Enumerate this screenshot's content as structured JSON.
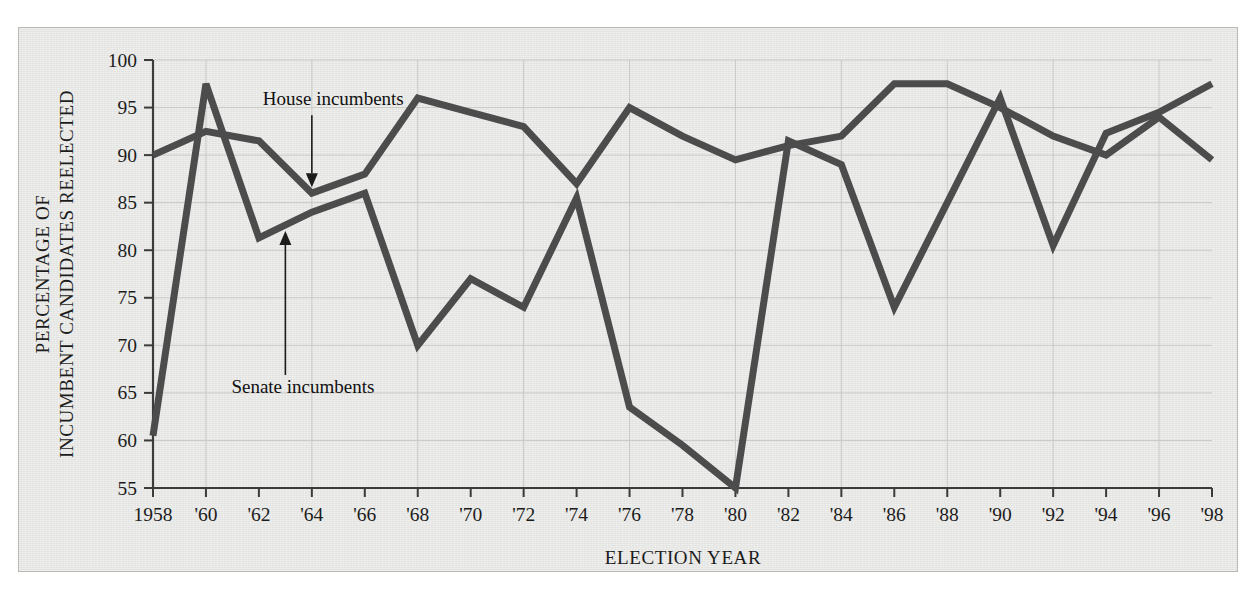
{
  "chart_data": {
    "type": "line",
    "title": "",
    "xlabel": "ELECTION YEAR",
    "ylabel": "PERCENTAGE OF INCUMBENT CANDIDATES REELECTED",
    "xlim": [
      1958,
      1998
    ],
    "ylim": [
      55,
      100
    ],
    "grid": true,
    "legend_position": "inline-annotations",
    "x": [
      1958,
      1960,
      1962,
      1964,
      1966,
      1968,
      1970,
      1972,
      1974,
      1976,
      1978,
      1980,
      1982,
      1984,
      1986,
      1988,
      1990,
      1992,
      1994,
      1996,
      1998
    ],
    "xtick_labels": [
      "1958",
      "'60",
      "'62",
      "'64",
      "'66",
      "'68",
      "'70",
      "'72",
      "'74",
      "'76",
      "'78",
      "'80",
      "'82",
      "'84",
      "'86",
      "'88",
      "'90",
      "'92",
      "'94",
      "'96",
      "'98"
    ],
    "ytick_labels": [
      "55",
      "60",
      "65",
      "70",
      "75",
      "80",
      "85",
      "90",
      "95",
      "100"
    ],
    "ytick_values": [
      55,
      60,
      65,
      70,
      75,
      80,
      85,
      90,
      95,
      100
    ],
    "series": [
      {
        "name": "House incumbents",
        "values": [
          90.0,
          92.5,
          91.5,
          86.0,
          88.0,
          96.0,
          94.5,
          93.0,
          87.0,
          95.0,
          92.0,
          89.5,
          91.0,
          92.0,
          97.5,
          97.5,
          95.0,
          92.0,
          90.0,
          94.0,
          89.5
        ]
      },
      {
        "name": "Senate incumbents",
        "values": [
          60.5,
          97.5,
          81.3,
          84.0,
          86.0,
          70.0,
          77.0,
          74.0,
          85.5,
          63.5,
          59.5,
          55.0,
          91.5,
          89.0,
          74.0,
          85.0,
          96.0,
          80.5,
          92.3,
          94.5,
          97.5
        ]
      }
    ],
    "annotations": [
      {
        "text": "House incumbents",
        "points_to_series": "House incumbents",
        "points_to_x": 1964,
        "direction": "down"
      },
      {
        "text": "Senate incumbents",
        "points_to_series": "Senate incumbents",
        "points_to_x": 1963,
        "direction": "up"
      }
    ],
    "colors": {
      "line": "#4c4c4c",
      "grid": "#c9c9c6",
      "axis": "#3b3b3b",
      "plot_background": "#e9e9e7",
      "text": "#1c1c1c"
    }
  }
}
